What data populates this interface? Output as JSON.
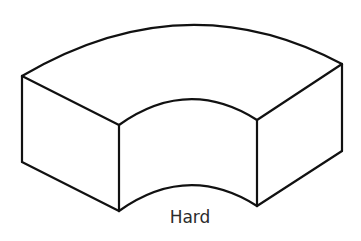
{
  "figure": {
    "shape": "curved-block (annular sector solid)",
    "caption": "Hard",
    "stroke_color": "#111111",
    "background": "#ffffff",
    "text_color": "#2b2b2b"
  }
}
